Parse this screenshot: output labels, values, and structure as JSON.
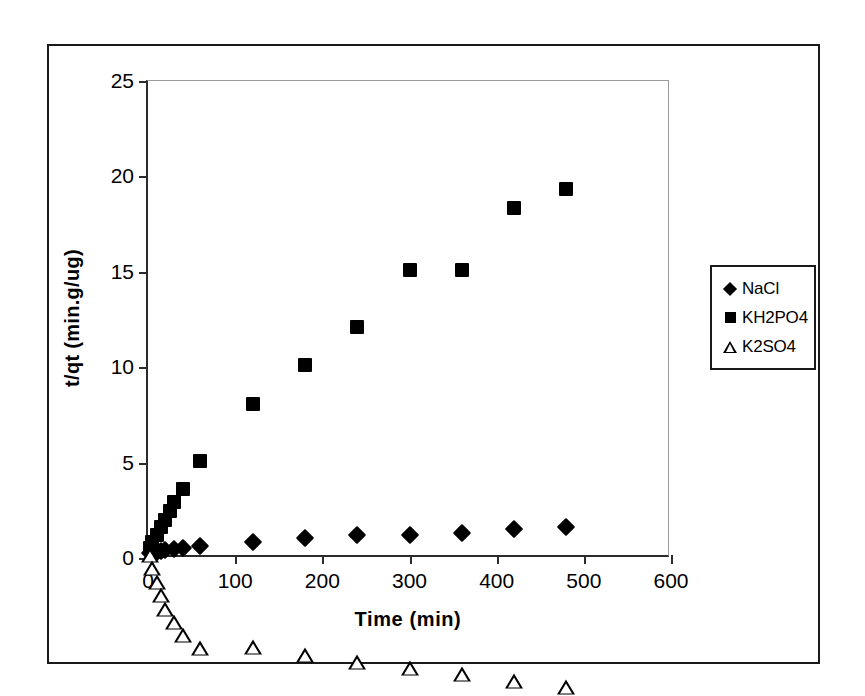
{
  "figure": {
    "border_color": "#1a1a1a",
    "background": "#ffffff"
  },
  "chart_data": {
    "type": "scatter",
    "title": "",
    "subtitle": "",
    "xlabel": "Time (min)",
    "ylabel": "t/qt (min.g/ug)",
    "xlim": [
      0,
      600
    ],
    "ylim": [
      0,
      25
    ],
    "xticks": [
      0,
      100,
      200,
      300,
      400,
      500,
      600
    ],
    "yticks": [
      0,
      5,
      10,
      15,
      20,
      25
    ],
    "xtick_labels": [
      "0",
      "100",
      "200",
      "300",
      "400",
      "500",
      "600"
    ],
    "ytick_labels": [
      "0",
      "5",
      "10",
      "15",
      "20",
      "25"
    ],
    "grid": false,
    "legend_position": "right-outside",
    "series": [
      {
        "name": "NaCl",
        "marker": "filled-diamond",
        "color": "#000000",
        "points": [
          {
            "x": 2,
            "y": 0.25
          },
          {
            "x": 5,
            "y": 0.3
          },
          {
            "x": 10,
            "y": 0.33
          },
          {
            "x": 15,
            "y": 0.38
          },
          {
            "x": 20,
            "y": 0.42
          },
          {
            "x": 30,
            "y": 0.48
          },
          {
            "x": 40,
            "y": 0.55
          },
          {
            "x": 60,
            "y": 0.62
          },
          {
            "x": 120,
            "y": 0.85
          },
          {
            "x": 180,
            "y": 1.05
          },
          {
            "x": 240,
            "y": 1.2
          },
          {
            "x": 300,
            "y": 1.22
          },
          {
            "x": 360,
            "y": 1.32
          },
          {
            "x": 420,
            "y": 1.5
          },
          {
            "x": 480,
            "y": 1.65
          }
        ]
      },
      {
        "name": "KH2PO4",
        "marker": "filled-square",
        "color": "#000000",
        "points": [
          {
            "x": 2,
            "y": 0.55
          },
          {
            "x": 5,
            "y": 0.85
          },
          {
            "x": 10,
            "y": 1.2
          },
          {
            "x": 15,
            "y": 1.6
          },
          {
            "x": 20,
            "y": 2.0
          },
          {
            "x": 25,
            "y": 2.45
          },
          {
            "x": 30,
            "y": 2.95
          },
          {
            "x": 40,
            "y": 3.6
          },
          {
            "x": 60,
            "y": 5.1
          },
          {
            "x": 120,
            "y": 8.05
          },
          {
            "x": 180,
            "y": 10.1
          },
          {
            "x": 240,
            "y": 12.1
          },
          {
            "x": 300,
            "y": 15.1
          },
          {
            "x": 360,
            "y": 15.1
          },
          {
            "x": 420,
            "y": 18.35
          },
          {
            "x": 480,
            "y": 19.35
          }
        ]
      },
      {
        "name": "K2SO4",
        "marker": "open-triangle",
        "color": "#000000",
        "points": [
          {
            "x": 2,
            "y": 0.18
          },
          {
            "x": 5,
            "y": 0.25
          },
          {
            "x": 10,
            "y": 0.32
          },
          {
            "x": 15,
            "y": 0.4
          },
          {
            "x": 20,
            "y": 0.48
          },
          {
            "x": 30,
            "y": 0.58
          },
          {
            "x": 40,
            "y": 0.66
          },
          {
            "x": 60,
            "y": 0.8
          },
          {
            "x": 120,
            "y": 1.6
          },
          {
            "x": 180,
            "y": 2.0
          },
          {
            "x": 240,
            "y": 2.4
          },
          {
            "x": 300,
            "y": 2.9
          },
          {
            "x": 360,
            "y": 3.35
          },
          {
            "x": 420,
            "y": 3.75
          },
          {
            "x": 480,
            "y": 4.25
          }
        ]
      }
    ],
    "legend": [
      {
        "label": "NaCl",
        "marker": "filled-diamond"
      },
      {
        "label": "KH2PO4",
        "marker": "filled-square"
      },
      {
        "label": "K2SO4",
        "marker": "open-triangle"
      }
    ]
  }
}
